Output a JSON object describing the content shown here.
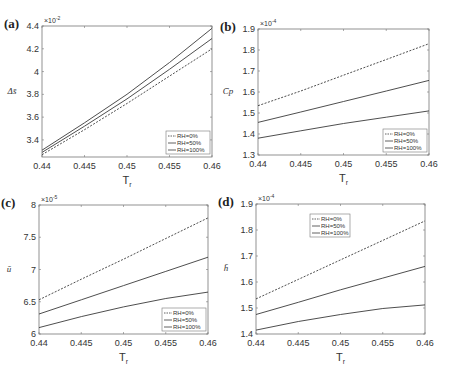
{
  "figure": {
    "width": 451,
    "height": 377,
    "line_color": "#3a3a3a",
    "axis_color": "#777777"
  },
  "chart_data": [
    {
      "panel": "(a)",
      "type": "line",
      "title": "",
      "xlabel": "T_r",
      "ylabel": "Δs̄",
      "y_multiplier": "×10^-2",
      "xlim": [
        0.44,
        0.46
      ],
      "ylim": [
        3.25,
        4.4
      ],
      "xticks": [
        "0.44",
        "0.445",
        "0.45",
        "0.455",
        "0.46"
      ],
      "yticks": [
        "3.4",
        "3.6",
        "3.8",
        "4",
        "4.2",
        "4.4"
      ],
      "legend_position": "lower right",
      "box": [
        42,
        26,
        212,
        157
      ],
      "x": [
        0.44,
        0.445,
        0.45,
        0.455,
        0.46
      ],
      "series": [
        {
          "name": "RH=0%",
          "style": "dashed",
          "values": [
            3.27,
            3.49,
            3.72,
            3.96,
            4.2
          ]
        },
        {
          "name": "RH=50%",
          "style": "solid",
          "values": [
            3.29,
            3.52,
            3.76,
            4.02,
            4.29
          ]
        },
        {
          "name": "RH=100%",
          "style": "solid",
          "values": [
            3.31,
            3.55,
            3.8,
            4.08,
            4.38
          ]
        }
      ],
      "grid": false
    },
    {
      "panel": "(b)",
      "type": "line",
      "title": "",
      "xlabel": "T_r",
      "ylabel": "C̄p",
      "y_multiplier": "×10^-4",
      "xlim": [
        0.44,
        0.46
      ],
      "ylim": [
        1.3,
        1.9
      ],
      "xticks": [
        "0.44",
        "0.445",
        "0.45",
        "0.455",
        "0.46"
      ],
      "yticks": [
        "1.3",
        "1.4",
        "1.5",
        "1.6",
        "1.7",
        "1.8",
        "1.9"
      ],
      "legend_position": "lower right",
      "box": [
        258,
        29,
        429,
        155
      ],
      "x": [
        0.44,
        0.445,
        0.45,
        0.455,
        0.46
      ],
      "series": [
        {
          "name": "RH=0%",
          "style": "dashed",
          "values": [
            1.535,
            1.605,
            1.68,
            1.755,
            1.83
          ]
        },
        {
          "name": "RH=50%",
          "style": "solid",
          "values": [
            1.455,
            1.505,
            1.555,
            1.605,
            1.655
          ]
        },
        {
          "name": "RH=100%",
          "style": "solid",
          "values": [
            1.38,
            1.415,
            1.45,
            1.48,
            1.51
          ]
        }
      ],
      "grid": false
    },
    {
      "panel": "(c)",
      "type": "line",
      "title": "",
      "xlabel": "T_r",
      "ylabel": "ū",
      "y_multiplier": "×10^-5",
      "xlim": [
        0.44,
        0.46
      ],
      "ylim": [
        6,
        8
      ],
      "xticks": [
        "0.44",
        "0.445",
        "0.45",
        "0.455",
        "0.46"
      ],
      "yticks": [
        "6",
        "6.5",
        "7",
        "7.5",
        "8"
      ],
      "legend_position": "lower right",
      "box": [
        39,
        205,
        208,
        334
      ],
      "x": [
        0.44,
        0.445,
        0.45,
        0.455,
        0.46
      ],
      "series": [
        {
          "name": "RH=0%",
          "style": "dashed",
          "values": [
            6.53,
            6.85,
            7.16,
            7.48,
            7.8
          ]
        },
        {
          "name": "RH=50%",
          "style": "solid",
          "values": [
            6.31,
            6.53,
            6.75,
            6.97,
            7.19
          ]
        },
        {
          "name": "RH=100%",
          "style": "solid",
          "values": [
            6.1,
            6.27,
            6.42,
            6.55,
            6.65
          ]
        }
      ],
      "grid": false
    },
    {
      "panel": "(d)",
      "type": "line",
      "title": "",
      "xlabel": "T_r",
      "ylabel": "h̄",
      "y_multiplier": "×10^-4",
      "xlim": [
        0.44,
        0.46
      ],
      "ylim": [
        1.4,
        1.9
      ],
      "xticks": [
        "0.44",
        "0.445",
        "0.45",
        "0.455",
        "0.46"
      ],
      "yticks": [
        "1.4",
        "1.5",
        "1.6",
        "1.7",
        "1.8",
        "1.9"
      ],
      "legend_position": "upper center",
      "box": [
        256,
        204,
        425,
        334
      ],
      "x": [
        0.44,
        0.445,
        0.45,
        0.455,
        0.46
      ],
      "series": [
        {
          "name": "RH=0%",
          "style": "dashed",
          "values": [
            1.535,
            1.61,
            1.685,
            1.76,
            1.835
          ]
        },
        {
          "name": "RH=50%",
          "style": "solid",
          "values": [
            1.475,
            1.522,
            1.57,
            1.615,
            1.66
          ]
        },
        {
          "name": "RH=100%",
          "style": "solid",
          "values": [
            1.415,
            1.448,
            1.475,
            1.498,
            1.512
          ]
        }
      ],
      "grid": false
    }
  ]
}
